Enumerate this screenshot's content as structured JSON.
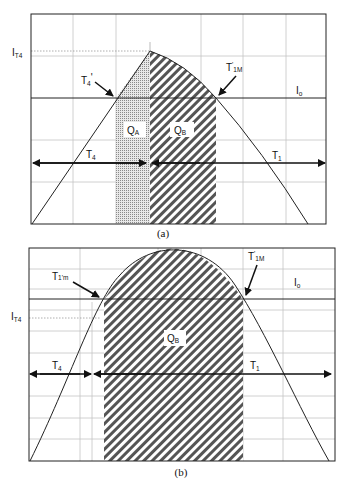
{
  "panels": [
    {
      "id": "a",
      "caption": "(a)",
      "labels": {
        "i_t4": {
          "main": "I",
          "sub": "T4"
        },
        "t4_prime": {
          "main": "T",
          "sub": "4",
          "mark": "'"
        },
        "t1m_prime": {
          "main": "T",
          "sub": "1M",
          "mark": "'"
        },
        "io": {
          "main": "I",
          "sub": "o"
        },
        "qa": {
          "main": "Q",
          "sub": "A"
        },
        "qb": {
          "main": "Q",
          "sub": "B"
        },
        "t4": {
          "main": "T",
          "sub": "4"
        },
        "t1": {
          "main": "T",
          "sub": "1"
        }
      }
    },
    {
      "id": "b",
      "caption": "(b)",
      "labels": {
        "i_t4": {
          "main": "I",
          "sub": "T4"
        },
        "t1m_lower_prime": {
          "main": "T",
          "sub": "1'm"
        },
        "t1m_prime": {
          "main": "T",
          "sub": "1M",
          "mark": "'"
        },
        "io": {
          "main": "I",
          "sub": "o"
        },
        "qb": {
          "main": "Q",
          "sub": "B"
        },
        "t4": {
          "main": "T",
          "sub": "4"
        },
        "t1": {
          "main": "T",
          "sub": "1"
        }
      }
    }
  ],
  "colors": {
    "line": "#222222",
    "grid": "#bdbdbd",
    "hatch": "#555555",
    "dots": "#9a9a9a"
  }
}
